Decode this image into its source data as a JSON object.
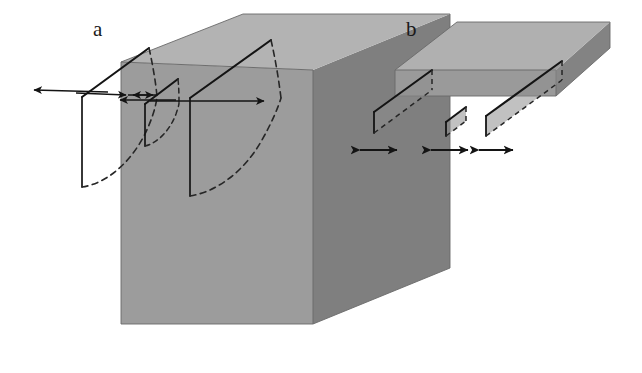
{
  "figure": {
    "type": "diagram",
    "background_color": "#ffffff"
  },
  "palette": {
    "top_face": "#b3b3b3",
    "front_face": "#9c9c9c",
    "side_face": "#7f7f7f",
    "plate_top_face": "#b0b0b0",
    "plate_front_face": "#9a9a9a",
    "plate_side_face": "#838383",
    "line_color": "#1a1a1a",
    "dash_color": "#2b2b2b",
    "label_color": "#1a1a1a",
    "background": "#ffffff"
  },
  "panels": [
    {
      "id": "a",
      "label": "a",
      "label_x": 93,
      "label_y": 36,
      "kind": "deep-block",
      "caption_text": "a",
      "block": {
        "top_face_points": "121,62 243,14 450,14 313,70",
        "front_face_points": "121,62 313,70 313,324 121,324",
        "side_face_points": "313,70 450,14 450,268 313,324",
        "outline_points": "121,62 243,14 450,14 450,268 313,324 121,324"
      },
      "cracks": [
        {
          "name": "crack-left-deep",
          "top_line": "82,97 149,48",
          "front_line": "82,97 82,187",
          "back_top_line": "149,48 161,96",
          "dashed_front": "82,187 96,180 112,168 126,152 139,131 150,108 157,97",
          "dashed_back_edge": "149,48 153,70 157,86 161,96"
        },
        {
          "name": "crack-middle-shallow",
          "top_line": "145,104 178,79",
          "front_line": "145,104 145,146",
          "dashed_front": "145,146 154,143 163,135 171,122 176,110 178,104",
          "dashed_back_edge": "178,79 179,92 179,101 178,104"
        },
        {
          "name": "crack-right-deep",
          "top_line": "190,98 271,40",
          "front_line": "190,98 190,196",
          "dashed_front": "190,196 205,190 220,176 234,158 247,135 258,112 265,98",
          "dashed_back_edge": "271,40 275,64 279,84 281,98"
        }
      ],
      "displacement_arrows": [
        {
          "name": "arrow-far-left",
          "x1": 108,
          "y1": 94,
          "x2": 32,
          "y2": 91,
          "head": "end",
          "direction": "left"
        },
        {
          "name": "arrow-left-inner",
          "x1": 78,
          "y1": 93,
          "x2": 126,
          "y2": 95,
          "head": "end",
          "direction": "right"
        },
        {
          "name": "arrow-mid-left",
          "x1": 175,
          "y1": 99,
          "x2": 119,
          "y2": 99,
          "head": "end",
          "direction": "left"
        },
        {
          "name": "arrow-mid-right",
          "x1": 131,
          "y1": 96,
          "x2": 152,
          "y2": 96,
          "head": "end",
          "direction": "right"
        },
        {
          "name": "arrow-mid-inner-left",
          "x1": 152,
          "y1": 96,
          "x2": 134,
          "y2": 96,
          "head": "end",
          "direction": "left"
        },
        {
          "name": "arrow-far-right",
          "x1": 150,
          "y1": 101,
          "x2": 262,
          "y2": 101,
          "head": "end",
          "direction": "right"
        }
      ]
    },
    {
      "id": "b",
      "label": "b",
      "label_x": 406,
      "label_y": 36,
      "kind": "thin-plate",
      "caption_text": "b",
      "plate": {
        "top_face_points": "395,70 457,22 610,22 556,70",
        "front_face_points": "395,70 556,70 556,96 395,96",
        "side_face_points": "556,70 610,22 610,48 556,96",
        "outline_points": "395,70 457,22 610,22 610,48 556,96 395,96"
      },
      "cracks": [
        {
          "name": "plate-crack-left",
          "top_line": "374,112 432,70",
          "front_line": "374,112 374,133",
          "dashed_top_back": "432,70 432,90",
          "dashed_bottom": "374,133 432,90"
        },
        {
          "name": "plate-crack-middle",
          "top_line": "446,122 466,107",
          "front_line": "446,122 446,136",
          "dashed_top_back": "466,107 466,120",
          "dashed_bottom": "446,136 466,120"
        },
        {
          "name": "plate-crack-right",
          "top_line": "486,116 562,61",
          "front_line": "486,116 486,136",
          "dashed_top_back": "562,61 562,80",
          "dashed_bottom": "486,136 562,80"
        }
      ],
      "opening_arrows": [
        {
          "name": "opening-arrow-left",
          "x1": 357,
          "y1": 150,
          "x2": 399,
          "y2": 150,
          "head": "both"
        },
        {
          "name": "opening-arrow-middle",
          "x1": 428,
          "y1": 150,
          "x2": 470,
          "y2": 150,
          "head": "both"
        },
        {
          "name": "opening-arrow-right",
          "x1": 476,
          "y1": 150,
          "x2": 515,
          "y2": 150,
          "head": "both"
        }
      ]
    }
  ]
}
